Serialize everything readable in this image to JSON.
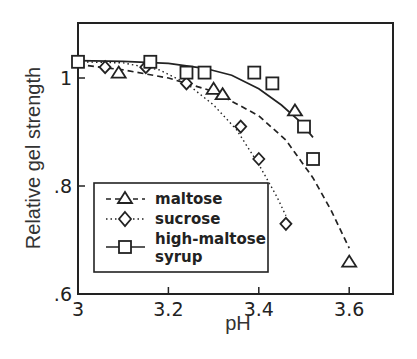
{
  "chart_data": {
    "type": "line",
    "title": "",
    "xlabel": "pH",
    "ylabel": "Relative gel strength",
    "xlim": [
      3.0,
      3.7
    ],
    "ylim": [
      0.6,
      1.1
    ],
    "xticks": [
      3.0,
      3.2,
      3.4,
      3.6
    ],
    "xtick_labels": [
      "3",
      "3.2",
      "3.4",
      "3.6"
    ],
    "yticks": [
      0.6,
      0.8,
      1.0
    ],
    "ytick_labels": [
      ".6",
      ".8",
      "1"
    ],
    "grid": false,
    "legend_position": "lower left (inset box)",
    "series": [
      {
        "name": "maltose",
        "marker": "triangle",
        "line_style": "dashed",
        "points": [
          {
            "x": 3.09,
            "y": 1.01
          },
          {
            "x": 3.3,
            "y": 0.98
          },
          {
            "x": 3.32,
            "y": 0.97
          },
          {
            "x": 3.48,
            "y": 0.94
          },
          {
            "x": 3.6,
            "y": 0.66
          }
        ],
        "fit": [
          [
            3.0,
            1.025
          ],
          [
            3.1,
            1.015
          ],
          [
            3.2,
            1.0
          ],
          [
            3.3,
            0.975
          ],
          [
            3.4,
            0.93
          ],
          [
            3.46,
            0.885
          ],
          [
            3.52,
            0.815
          ],
          [
            3.56,
            0.755
          ],
          [
            3.6,
            0.685
          ]
        ]
      },
      {
        "name": "sucrose",
        "marker": "diamond",
        "line_style": "dotted",
        "points": [
          {
            "x": 3.06,
            "y": 1.02
          },
          {
            "x": 3.15,
            "y": 1.02
          },
          {
            "x": 3.24,
            "y": 0.99
          },
          {
            "x": 3.36,
            "y": 0.91
          },
          {
            "x": 3.4,
            "y": 0.85
          },
          {
            "x": 3.46,
            "y": 0.73
          }
        ],
        "fit": [
          [
            3.0,
            1.03
          ],
          [
            3.1,
            1.028
          ],
          [
            3.18,
            1.015
          ],
          [
            3.24,
            0.99
          ],
          [
            3.3,
            0.95
          ],
          [
            3.35,
            0.905
          ],
          [
            3.4,
            0.84
          ],
          [
            3.44,
            0.78
          ],
          [
            3.46,
            0.745
          ]
        ]
      },
      {
        "name": "high-maltose syrup",
        "marker": "square",
        "line_style": "solid",
        "points": [
          {
            "x": 3.0,
            "y": 1.03
          },
          {
            "x": 3.16,
            "y": 1.03
          },
          {
            "x": 3.24,
            "y": 1.01
          },
          {
            "x": 3.28,
            "y": 1.01
          },
          {
            "x": 3.39,
            "y": 1.01
          },
          {
            "x": 3.43,
            "y": 0.99
          },
          {
            "x": 3.5,
            "y": 0.91
          },
          {
            "x": 3.52,
            "y": 0.85
          }
        ],
        "fit": [
          [
            3.0,
            1.032
          ],
          [
            3.1,
            1.031
          ],
          [
            3.2,
            1.027
          ],
          [
            3.28,
            1.018
          ],
          [
            3.34,
            1.005
          ],
          [
            3.4,
            0.98
          ],
          [
            3.45,
            0.95
          ],
          [
            3.49,
            0.92
          ],
          [
            3.52,
            0.89
          ]
        ]
      }
    ],
    "legend": [
      {
        "label": "maltose",
        "marker": "triangle",
        "line_style": "dashed"
      },
      {
        "label": "sucrose",
        "marker": "diamond",
        "line_style": "dotted"
      },
      {
        "label": "high-maltose",
        "label_line2": "syrup",
        "marker": "square",
        "line_style": "solid"
      }
    ]
  },
  "layout": {
    "plot_left": 78,
    "plot_right": 393,
    "plot_top": 23,
    "plot_bottom": 294,
    "x_scale_px_per_unit": 452,
    "y_scale_px_per_unit": 540,
    "line_color": "#222222"
  }
}
